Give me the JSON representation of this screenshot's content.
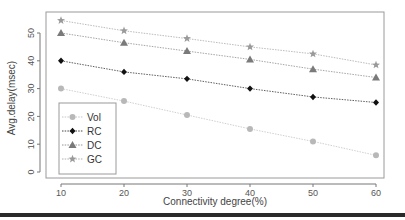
{
  "chart_data": {
    "type": "line",
    "title": "",
    "xlabel": "Connectivity degree(%)",
    "ylabel": "Avg.delay(msec)",
    "x": [
      10,
      20,
      30,
      40,
      50,
      60
    ],
    "xticks": [
      "10",
      "20",
      "30",
      "40",
      "50",
      "60"
    ],
    "yticks": [
      "0",
      "10",
      "20",
      "30",
      "40",
      "50"
    ],
    "xlim": [
      8,
      62
    ],
    "ylim": [
      -1,
      56
    ],
    "grid": false,
    "legend_position": "bottom-left",
    "series": [
      {
        "name": "Vol",
        "marker": "circle",
        "color": "#b8b8b8",
        "line_style": "dotted",
        "values": [
          30,
          25.5,
          20.5,
          15.5,
          11,
          6
        ]
      },
      {
        "name": "RC",
        "marker": "diamond",
        "color": "#111111",
        "line_style": "dotted",
        "values": [
          40,
          36,
          33.5,
          30,
          27,
          25
        ]
      },
      {
        "name": "DC",
        "marker": "triangle",
        "color": "#7a7a7a",
        "line_style": "dotted",
        "values": [
          50,
          46.5,
          43.5,
          40.5,
          37,
          34
        ]
      },
      {
        "name": "GC",
        "marker": "star",
        "color": "#9a9a9a",
        "line_style": "dotted",
        "values": [
          54.5,
          50.8,
          48,
          45,
          42.5,
          38.5
        ]
      }
    ]
  }
}
